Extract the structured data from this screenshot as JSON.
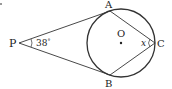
{
  "diagram": {
    "type": "geometry",
    "points": {
      "P": {
        "label": "P",
        "x": 19,
        "y": 43
      },
      "A": {
        "label": "A",
        "x": 110,
        "y": 10
      },
      "B": {
        "label": "B",
        "x": 110,
        "y": 76
      },
      "C": {
        "label": "C",
        "x": 155,
        "y": 43
      },
      "O": {
        "label": "O",
        "x": 121,
        "y": 43
      }
    },
    "circle": {
      "center": "O",
      "cx": 121,
      "cy": 43,
      "r": 34
    },
    "segments": [
      [
        "P",
        "A"
      ],
      [
        "P",
        "B"
      ],
      [
        "A",
        "C"
      ],
      [
        "B",
        "C"
      ]
    ],
    "angles": {
      "P": {
        "value": "38°",
        "text": "38"
      },
      "C": {
        "value": "x",
        "text": "x"
      }
    },
    "line_color": "#333333"
  }
}
